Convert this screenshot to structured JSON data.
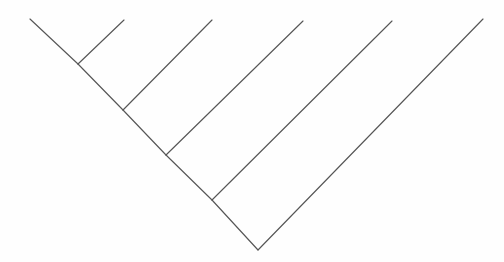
{
  "figure": {
    "type": "phylogenetic-tree",
    "topology": "ladderized-pectinate",
    "orientation": "tips-up",
    "background_color": "#fefefe",
    "line_color": "#565656",
    "line_width": 1.15,
    "width": 504,
    "height": 262,
    "tip_count": 6,
    "internal_node_count": 5
  },
  "chart_data": {
    "type": "tree",
    "title": "",
    "xlabel": "",
    "ylabel": "",
    "nodes": [
      {
        "id": "root",
        "x": 258,
        "y": 250,
        "kind": "internal"
      },
      {
        "id": "node4",
        "x": 212,
        "y": 200,
        "kind": "internal"
      },
      {
        "id": "node3",
        "x": 166,
        "y": 155,
        "kind": "internal"
      },
      {
        "id": "node2",
        "x": 123,
        "y": 110,
        "kind": "internal"
      },
      {
        "id": "node1",
        "x": 78,
        "y": 64,
        "kind": "internal"
      },
      {
        "id": "tip1",
        "x": 30,
        "y": 19,
        "kind": "tip"
      },
      {
        "id": "tip2",
        "x": 124,
        "y": 20,
        "kind": "tip"
      },
      {
        "id": "tip3",
        "x": 212,
        "y": 20,
        "kind": "tip"
      },
      {
        "id": "tip4",
        "x": 303,
        "y": 21,
        "kind": "tip"
      },
      {
        "id": "tip5",
        "x": 392,
        "y": 21,
        "kind": "tip"
      },
      {
        "id": "tip6",
        "x": 483,
        "y": 19,
        "kind": "tip"
      }
    ],
    "edges": [
      {
        "id": "edge-root-tip6",
        "from": "root",
        "to": "tip6",
        "d": "M 258 250 L 483 19"
      },
      {
        "id": "edge-root-node4",
        "from": "root",
        "to": "node4",
        "d": "M 258 250 L 212 200"
      },
      {
        "id": "edge-node4-tip5",
        "from": "node4",
        "to": "tip5",
        "d": "M 212 200 L 392 21"
      },
      {
        "id": "edge-node4-node3",
        "from": "node4",
        "to": "node3",
        "d": "M 212 200 L 166 155"
      },
      {
        "id": "edge-node3-tip4",
        "from": "node3",
        "to": "tip4",
        "d": "M 166 155 L 303 21"
      },
      {
        "id": "edge-node3-node2",
        "from": "node3",
        "to": "node2",
        "d": "M 166 155 L 123 110"
      },
      {
        "id": "edge-node2-tip3",
        "from": "node2",
        "to": "tip3",
        "d": "M 123 110 L 212 20"
      },
      {
        "id": "edge-node2-node1",
        "from": "node2",
        "to": "node1",
        "d": "M 123 110 L 78 64"
      },
      {
        "id": "edge-node1-tip2",
        "from": "node1",
        "to": "tip2",
        "d": "M 78 64 L 124 20"
      },
      {
        "id": "edge-node1-tip1",
        "from": "node1",
        "to": "tip1",
        "d": "M 78 64 L 30 19"
      }
    ],
    "tick_labels": [],
    "legend": [],
    "annotations": [],
    "grid": false
  }
}
